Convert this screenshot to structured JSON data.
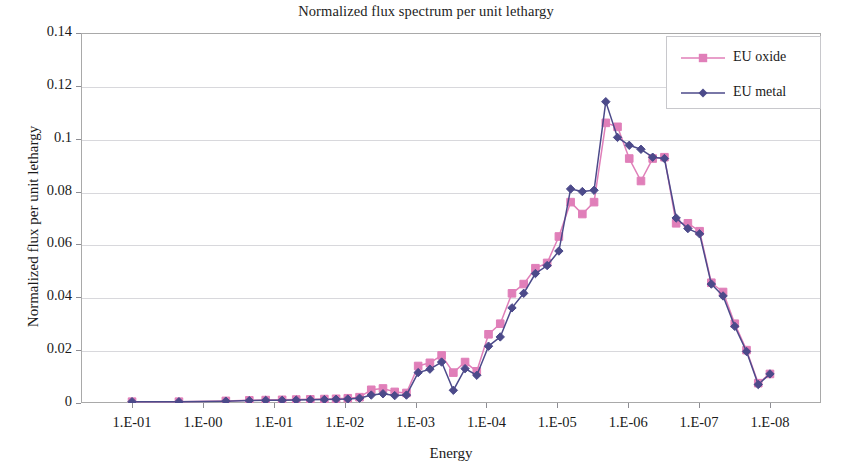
{
  "chart_data": {
    "type": "line",
    "title": "Normalized flux spectrum per unit lethargy",
    "xlabel": "Energy",
    "ylabel": "Normalized flux per unit lethargy",
    "grid": "horizontal",
    "legend_position": "top-right",
    "ylim": [
      0,
      0.14
    ],
    "yticks": [
      "0",
      "0.02",
      "0.04",
      "0.06",
      "0.08",
      "0.1",
      "0.12",
      "0.14"
    ],
    "ytick_values": [
      0,
      0.02,
      0.04,
      0.06,
      0.08,
      0.1,
      0.12,
      0.14
    ],
    "xticks": [
      "1.E-01",
      "1.E-00",
      "1.E-01",
      "1.E-02",
      "1.E-03",
      "1.E-04",
      "1.E-05",
      "1.E-06",
      "1.E-07",
      "1.E-08"
    ],
    "x_index": [
      0,
      1,
      2,
      3,
      4,
      5,
      6,
      7,
      8,
      9
    ],
    "x_positions": [
      0.5,
      1.5,
      2.5,
      3.0,
      3.35,
      3.7,
      4.0,
      4.3,
      4.6,
      4.85,
      5.1,
      5.35,
      5.6,
      5.85,
      6.1,
      6.35,
      6.6,
      6.85,
      7.1,
      7.35,
      7.6,
      7.85,
      8.1,
      8.35,
      8.6,
      8.85,
      9.1,
      9.35,
      9.6,
      9.85,
      10.1,
      10.35,
      10.6,
      10.85,
      11.1,
      11.35,
      11.6,
      11.85,
      12.1,
      12.35,
      12.6,
      12.85,
      13.1,
      13.35,
      13.6,
      13.85,
      14.1
    ],
    "series": [
      {
        "name": "EU oxide",
        "color": "#e07fb9",
        "marker": "square",
        "values": [
          0.0005,
          0.0005,
          0.0008,
          0.001,
          0.0011,
          0.0012,
          0.0013,
          0.0014,
          0.0015,
          0.0016,
          0.0018,
          0.0022,
          0.005,
          0.0055,
          0.0042,
          0.0038,
          0.014,
          0.0152,
          0.018,
          0.0115,
          0.0155,
          0.012,
          0.026,
          0.03,
          0.0415,
          0.045,
          0.051,
          0.053,
          0.063,
          0.076,
          0.0715,
          0.076,
          0.106,
          0.1045,
          0.0925,
          0.084,
          0.0925,
          0.093,
          0.068,
          0.068,
          0.065,
          0.0455,
          0.042,
          0.03,
          0.02,
          0.0075,
          0.011
        ]
      },
      {
        "name": "EU metal",
        "color": "#4c4a8a",
        "marker": "diamond",
        "values": [
          0.0005,
          0.0005,
          0.0007,
          0.0009,
          0.001,
          0.001,
          0.0011,
          0.0012,
          0.0013,
          0.0014,
          0.0015,
          0.0018,
          0.003,
          0.0035,
          0.0028,
          0.003,
          0.0115,
          0.0128,
          0.0155,
          0.0048,
          0.013,
          0.0105,
          0.0215,
          0.025,
          0.036,
          0.0415,
          0.049,
          0.052,
          0.0575,
          0.081,
          0.08,
          0.0805,
          0.114,
          0.1005,
          0.0975,
          0.096,
          0.093,
          0.0925,
          0.07,
          0.066,
          0.064,
          0.045,
          0.0405,
          0.029,
          0.0195,
          0.007,
          0.011
        ]
      }
    ]
  }
}
